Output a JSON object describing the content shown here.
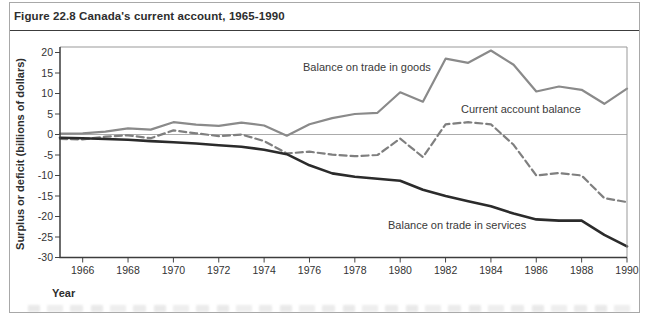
{
  "figure": {
    "title": "Figure 22.8 Canada's current account, 1965-1990"
  },
  "chart_data": {
    "type": "line",
    "title": "Figure 22.8 Canada's current account, 1965-1990",
    "xlabel": "Year",
    "ylabel": "Surplus or deficit (billions of dollars)",
    "xlim": [
      1965,
      1990
    ],
    "ylim": [
      -30,
      20
    ],
    "x_ticks": [
      1966,
      1968,
      1970,
      1972,
      1974,
      1976,
      1978,
      1980,
      1982,
      1984,
      1986,
      1988,
      1990
    ],
    "y_ticks": [
      20,
      15,
      10,
      5,
      0,
      -5,
      -10,
      -15,
      -20,
      -25,
      -30
    ],
    "zero_line": true,
    "grid": false,
    "legend_position": "inline-annotations",
    "x": [
      1965,
      1966,
      1967,
      1968,
      1969,
      1970,
      1971,
      1972,
      1973,
      1974,
      1975,
      1976,
      1977,
      1978,
      1979,
      1980,
      1981,
      1982,
      1983,
      1984,
      1985,
      1986,
      1987,
      1988,
      1989,
      1990
    ],
    "series": [
      {
        "name": "Balance on trade in goods",
        "line_style": "solid",
        "color": "#8a8a8a",
        "values": [
          0.2,
          0.3,
          0.7,
          1.5,
          1.2,
          3.0,
          2.4,
          2.1,
          2.9,
          2.2,
          -0.3,
          2.5,
          4.0,
          5.0,
          5.3,
          10.3,
          8.0,
          18.5,
          17.5,
          20.5,
          17.0,
          10.5,
          11.7,
          10.9,
          7.5,
          11.2
        ]
      },
      {
        "name": "Current account balance",
        "line_style": "dashed",
        "color": "#7f7f7f",
        "values": [
          -1.1,
          -1.2,
          -0.5,
          -0.2,
          -0.9,
          1.0,
          0.3,
          -0.4,
          0.0,
          -1.6,
          -4.6,
          -4.2,
          -4.9,
          -5.3,
          -5.0,
          -1.0,
          -5.5,
          2.5,
          3.0,
          2.5,
          -2.5,
          -10.0,
          -9.4,
          -10.0,
          -15.5,
          -16.5
        ]
      },
      {
        "name": "Balance on trade in services",
        "line_style": "solid",
        "color": "#2b2b2b",
        "values": [
          -0.8,
          -0.9,
          -1.1,
          -1.3,
          -1.6,
          -1.9,
          -2.2,
          -2.6,
          -3.0,
          -3.7,
          -4.8,
          -7.5,
          -9.5,
          -10.3,
          -10.8,
          -11.3,
          -13.5,
          -15.0,
          -16.3,
          -17.5,
          -19.3,
          -20.7,
          -21.0,
          -21.0,
          -24.5,
          -27.3
        ]
      }
    ]
  }
}
